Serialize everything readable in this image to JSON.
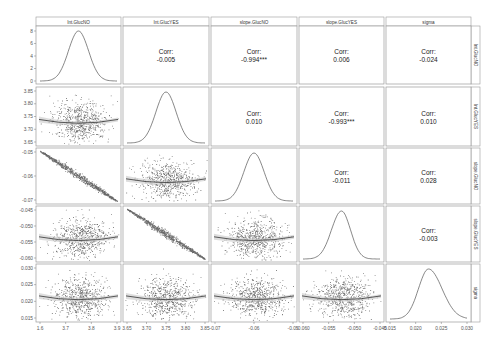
{
  "chart_data": {
    "type": "scatter-matrix",
    "title": "",
    "variables": [
      "Int.GlucNO",
      "Int.GlucYES",
      "slope.GlucNO",
      "slope.GlucYES",
      "sigma"
    ],
    "column_labels": [
      "Int.GlucNO",
      "Int.GlucYES",
      "slope.GlucNO",
      "slope.GlucYES",
      "sigma"
    ],
    "row_labels": [
      "Int.GlucNO",
      "Int.GlucYES",
      "slope.GlucNO",
      "slope.GlucYES",
      "sigma"
    ],
    "diagonal": "density",
    "lower": "scatter with loess smooth",
    "upper": "correlation text",
    "correlations": [
      {
        "row": "Int.GlucNO",
        "col": "Int.GlucYES",
        "label": "Corr:",
        "value": "-0.005"
      },
      {
        "row": "Int.GlucNO",
        "col": "slope.GlucNO",
        "label": "Corr:",
        "value": "-0.994***"
      },
      {
        "row": "Int.GlucNO",
        "col": "slope.GlucYES",
        "label": "Corr:",
        "value": "0.006"
      },
      {
        "row": "Int.GlucNO",
        "col": "sigma",
        "label": "Corr:",
        "value": "-0.024"
      },
      {
        "row": "Int.GlucYES",
        "col": "slope.GlucNO",
        "label": "Corr:",
        "value": "0.010"
      },
      {
        "row": "Int.GlucYES",
        "col": "slope.GlucYES",
        "label": "Corr:",
        "value": "-0.993***"
      },
      {
        "row": "Int.GlucYES",
        "col": "sigma",
        "label": "Corr:",
        "value": "0.010"
      },
      {
        "row": "slope.GlucNO",
        "col": "slope.GlucYES",
        "label": "Corr:",
        "value": "-0.011"
      },
      {
        "row": "slope.GlucNO",
        "col": "sigma",
        "label": "Corr:",
        "value": "0.028"
      },
      {
        "row": "slope.GlucYES",
        "col": "sigma",
        "label": "Corr:",
        "value": "-0.003"
      }
    ],
    "x_ticks": {
      "Int.GlucNO": [
        "1.6",
        "3.7",
        "3.8",
        "3.9"
      ],
      "Int.GlucYES": [
        "3.65",
        "3.70",
        "3.75",
        "3.80",
        "3.85"
      ],
      "slope.GlucNO": [
        "-0.07",
        "-0.06",
        "-0.05"
      ],
      "slope.GlucYES": [
        "-0.060",
        "-0.055",
        "-0.050",
        "-0.045"
      ],
      "sigma": [
        "0.015",
        "0.020",
        "0.025",
        "0.030"
      ]
    },
    "y_ticks": {
      "Int.GlucNO": [
        "0",
        "2",
        "4",
        "6",
        "8"
      ],
      "Int.GlucYES": [
        "3.65",
        "3.70",
        "3.75",
        "3.80",
        "3.85"
      ],
      "slope.GlucNO": [
        "-0.05",
        "-0.06",
        "-0.07"
      ],
      "slope.GlucYES": [
        "-0.045",
        "-0.050",
        "-0.055",
        "-0.060"
      ],
      "sigma": [
        "0.030",
        "0.025",
        "0.020",
        "0.015"
      ]
    },
    "density_peaks": {
      "Int.GlucNO": 3.76,
      "Int.GlucYES": 3.755,
      "slope.GlucNO": -0.0605,
      "slope.GlucYES": -0.0535,
      "sigma": 0.0205
    },
    "grid": false,
    "legend": "none"
  },
  "colors": {
    "points": "#1a1a1a",
    "panel_border": "#9a9a9a",
    "strip_fill": "#ffffff",
    "smooth_line": "#333333",
    "smooth_band": "#c8c8c8"
  }
}
